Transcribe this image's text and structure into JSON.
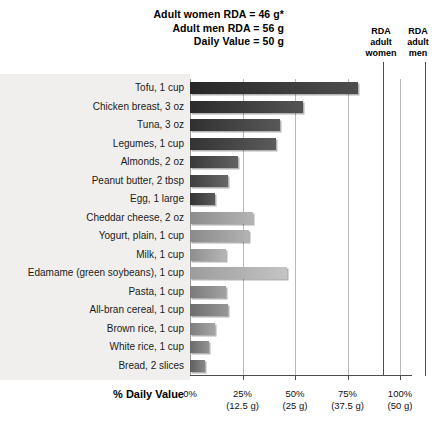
{
  "header": {
    "lines": [
      "Adult women RDA = 46 g*",
      "Adult men RDA = 56 g",
      "Daily Value = 50 g"
    ]
  },
  "rda_markers": [
    {
      "name": "rda-adult-women",
      "label": "RDA\nadult\nwomen",
      "label_line1": "RDA",
      "label_line2": "adult",
      "label_line3": "women",
      "percent": 92
    },
    {
      "name": "rda-adult-men",
      "label_line1": "RDA",
      "label_line2": "adult",
      "label_line3": "men",
      "percent": 112
    }
  ],
  "axis": {
    "title": "% Daily Value",
    "ticks": [
      {
        "percent": 0,
        "label": "0%",
        "grams": ""
      },
      {
        "percent": 25,
        "label": "25%",
        "grams": "(12.5 g)"
      },
      {
        "percent": 50,
        "label": "50%",
        "grams": "(25 g)"
      },
      {
        "percent": 75,
        "label": "75%",
        "grams": "(37.5 g)"
      },
      {
        "percent": 100,
        "label": "100%",
        "grams": "(50 g)"
      }
    ]
  },
  "chart_data": {
    "type": "bar",
    "xlabel": "% Daily Value",
    "ylabel": "",
    "xlim": [
      0,
      100
    ],
    "grid": true,
    "legend": "none",
    "orientation": "horizontal",
    "categories": [
      "Tofu, 1 cup",
      "Chicken breast, 3 oz",
      "Tuna, 3 oz",
      "Legumes, 1 cup",
      "Almonds, 2 oz",
      "Peanut butter, 2 tbsp",
      "Egg, 1 large",
      "Cheddar cheese, 2 oz",
      "Yogurt, plain, 1 cup",
      "Milk, 1 cup",
      "Edamame (green soybeans), 1 cup",
      "Pasta, 1 cup",
      "All-bran cereal, 1 cup",
      "Brown rice, 1 cup",
      "White rice, 1 cup",
      "Bread, 2 slices"
    ],
    "values": [
      80,
      54,
      43,
      41,
      23,
      18,
      12,
      30,
      28,
      17,
      46,
      17,
      18,
      12,
      9,
      7
    ],
    "bar_colors": [
      "#262626",
      "#2b2b2b",
      "#303030",
      "#333333",
      "#3a3a3a",
      "#3f3f3f",
      "#333333",
      "#8c8c8c",
      "#8a8a8a",
      "#8e8e8e",
      "#9c9c9c",
      "#7a7a7a",
      "#6e6e6e",
      "#7d7d7d",
      "#6a6a6a",
      "#5f5f5f"
    ],
    "annotations": [
      "Adult women RDA = 46 g*",
      "Adult men RDA = 56 g",
      "Daily Value = 50 g",
      "RDA adult women marker at 92%",
      "RDA adult men marker at 112%"
    ]
  }
}
